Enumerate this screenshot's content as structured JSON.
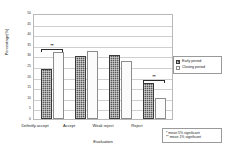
{
  "chart_data": {
    "type": "bar",
    "title": "",
    "xlabel": "Evaluation",
    "ylabel": "Percentage(%)",
    "categories": [
      "Definitly accept",
      "Accept",
      "Weak reject",
      "Reject"
    ],
    "ylim": [
      0,
      50
    ],
    "yticks": [
      "50",
      "45",
      "40",
      "35",
      "30",
      "25",
      "20",
      "15",
      "10",
      "5",
      "0"
    ],
    "grid": true,
    "legend_position": "right",
    "series": [
      {
        "name": "Early period",
        "values": [
          23.5,
          29.7,
          30.3,
          17.2
        ]
      },
      {
        "name": "Closing period",
        "values": [
          31.8,
          32.3,
          27.5,
          10.0
        ]
      }
    ],
    "annotations": [
      {
        "group": "Definitly accept",
        "marker": "**"
      },
      {
        "group": "Reject",
        "marker": "**"
      }
    ],
    "footnotes": [
      "*  mean 5% significant",
      "** mean 1% significant"
    ]
  }
}
